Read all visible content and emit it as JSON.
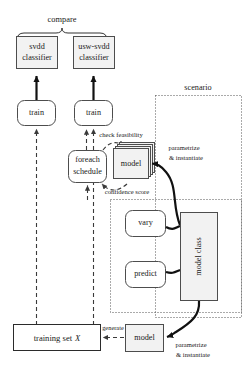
{
  "diagram": {
    "title_region_labels": {
      "compare": "compare",
      "scenario": "scenario"
    },
    "nodes": {
      "svdd_classifier": "svdd\nclassifier",
      "svdd_classifier_line1": "svdd",
      "svdd_classifier_line2": "classifier",
      "usw_svdd_classifier_line1": "usw-svdd",
      "usw_svdd_classifier_line2": "classifier",
      "train_left": "train",
      "train_right": "train",
      "foreach_schedule_line1": "foreach",
      "foreach_schedule_line2": "schedule",
      "model_stack": "model",
      "vary": "vary",
      "predict": "predict",
      "model_class": "model class",
      "training_set": "training set X",
      "training_set_plain": "training set",
      "training_set_italic": "X",
      "model_bottom": "model"
    },
    "edge_labels": {
      "check_feasibility": "check feasibility",
      "confidence_score": "confidence score",
      "parametrize_instantiate_top_line1": "parametrize",
      "parametrize_instantiate_top_line2": "& instantiate",
      "parametrize_instantiate_bottom_line1": "parametrize",
      "parametrize_instantiate_bottom_line2": "& instantiate",
      "generate": "generate"
    },
    "colors": {
      "box_fill": "#f2f2f2",
      "box_stroke": "#4d4d4d",
      "white_fill": "#ffffff",
      "text": "#1a1a1a",
      "dotted_region": "#555555",
      "dashed_edge": "#3a3a3a",
      "solid_edge": "#111111",
      "background": "#ffffff"
    }
  }
}
